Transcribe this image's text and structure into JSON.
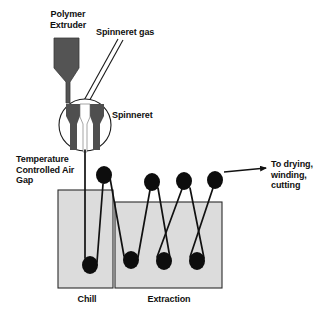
{
  "figure": {
    "background_color": "#ffffff"
  },
  "labels": {
    "polymer_extruder": "Polymer\nExtruder",
    "spinneret_gas": "Spinneret gas",
    "spinneret": "Spinneret",
    "air_gap": "Temperature\nControlled Air\nGap",
    "to_drying": "To drying,\nwinding,\ncutting",
    "chill": "Chill",
    "extraction": "Extraction"
  },
  "colors": {
    "outline": "#1a1a1a",
    "extruder_fill": "#545454",
    "spinneret_fill": "#4f4f4f",
    "bath_fill": "#dcdcdc",
    "bath_stroke": "#2b2b2b",
    "roller_fill": "#0d0d0d",
    "fiber_stroke": "#111111",
    "text": "#101010"
  },
  "components": {
    "extruder": {
      "name": "Polymer Extruder",
      "x": 54,
      "y": 38,
      "width": 25,
      "height": 40,
      "neck_width": 6
    },
    "gas_line": {
      "name": "Spinneret gas inlet",
      "from_x": 122,
      "from_y": 40,
      "to_x": 84,
      "to_y": 104
    },
    "spinneret": {
      "name": "Spinneret",
      "center_x": 85,
      "center_y": 125,
      "radius": 26
    },
    "air_gap": {
      "name": "Temperature Controlled Air Gap",
      "from_y": 151,
      "to_y": 190
    },
    "baths": [
      {
        "name": "Chill",
        "x": 58,
        "y": 190,
        "width": 55,
        "height": 98
      },
      {
        "name": "Extraction",
        "x": 115,
        "y": 202,
        "width": 107,
        "height": 86
      }
    ],
    "rollers_top": [
      {
        "cx": 104,
        "cy": 175
      },
      {
        "cx": 152,
        "cy": 182
      },
      {
        "cx": 184,
        "cy": 181
      },
      {
        "cx": 215,
        "cy": 180
      }
    ],
    "rollers_bottom": [
      {
        "cx": 90,
        "cy": 265
      },
      {
        "cx": 131,
        "cy": 260
      },
      {
        "cx": 164,
        "cy": 261
      },
      {
        "cx": 197,
        "cy": 261
      }
    ],
    "roller_rx": 8,
    "roller_ry": 9,
    "exit_arrow": {
      "from_x": 224,
      "from_y": 172,
      "to_x": 268,
      "to_y": 168
    }
  }
}
